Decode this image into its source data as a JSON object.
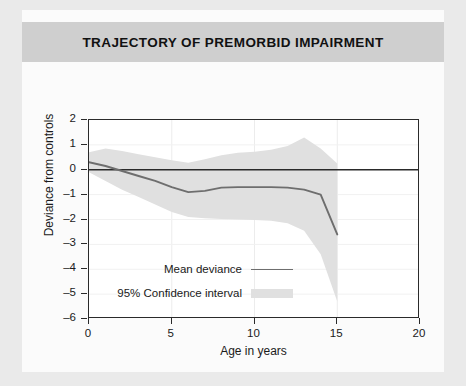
{
  "figure": {
    "title": "TRAJECTORY OF PREMORBID IMPAIRMENT",
    "background_color": "#eaeaea",
    "panel_color": "#fbfbfb",
    "title_band_color": "#cfcfcf"
  },
  "chart_data": {
    "type": "line",
    "title": "TRAJECTORY OF PREMORBID IMPAIRMENT",
    "xlabel": "Age in years",
    "ylabel": "Deviance from controls",
    "xlim": [
      0,
      20
    ],
    "ylim": [
      -6,
      2
    ],
    "xticks": [
      0,
      5,
      10,
      15,
      20
    ],
    "yticks": [
      2,
      1,
      0,
      -1,
      -2,
      -3,
      -4,
      -5,
      -6
    ],
    "xtick_labels": [
      "0",
      "5",
      "10",
      "15",
      "20"
    ],
    "ytick_labels": [
      "2",
      "1",
      "0",
      "-1",
      "-2",
      "-3",
      "-4",
      "-5",
      "-6"
    ],
    "grid": "faint vertical and horizontal gridlines",
    "legend_position": "lower-left inside axes",
    "zero_reference_line": 0,
    "line_color": "#6e6e6e",
    "band_color": "#e0e0e0",
    "axis_color": "#2a2a2a",
    "x": [
      0,
      1,
      2,
      3,
      4,
      5,
      6,
      7,
      8,
      9,
      10,
      11,
      12,
      13,
      14,
      15
    ],
    "series": [
      {
        "name": "Mean deviance",
        "values": [
          0.3,
          0.15,
          -0.05,
          -0.25,
          -0.45,
          -0.7,
          -0.9,
          -0.85,
          -0.72,
          -0.7,
          -0.7,
          -0.7,
          -0.72,
          -0.8,
          -1.0,
          -2.6
        ]
      },
      {
        "name": "95% Confidence interval upper",
        "values": [
          0.7,
          0.85,
          0.75,
          0.62,
          0.5,
          0.38,
          0.28,
          0.42,
          0.58,
          0.68,
          0.72,
          0.8,
          0.95,
          1.3,
          0.85,
          0.25
        ]
      },
      {
        "name": "95% Confidence interval lower",
        "values": [
          -0.1,
          -0.45,
          -0.8,
          -1.1,
          -1.4,
          -1.7,
          -1.9,
          -1.95,
          -1.98,
          -2.0,
          -2.02,
          -2.05,
          -2.15,
          -2.45,
          -3.4,
          -5.3
        ]
      }
    ],
    "legend": [
      {
        "label": "Mean deviance",
        "marker": "line",
        "color": "#6e6e6e"
      },
      {
        "label": "95% Confidence interval",
        "marker": "band",
        "color": "#e0e0e0"
      }
    ]
  }
}
